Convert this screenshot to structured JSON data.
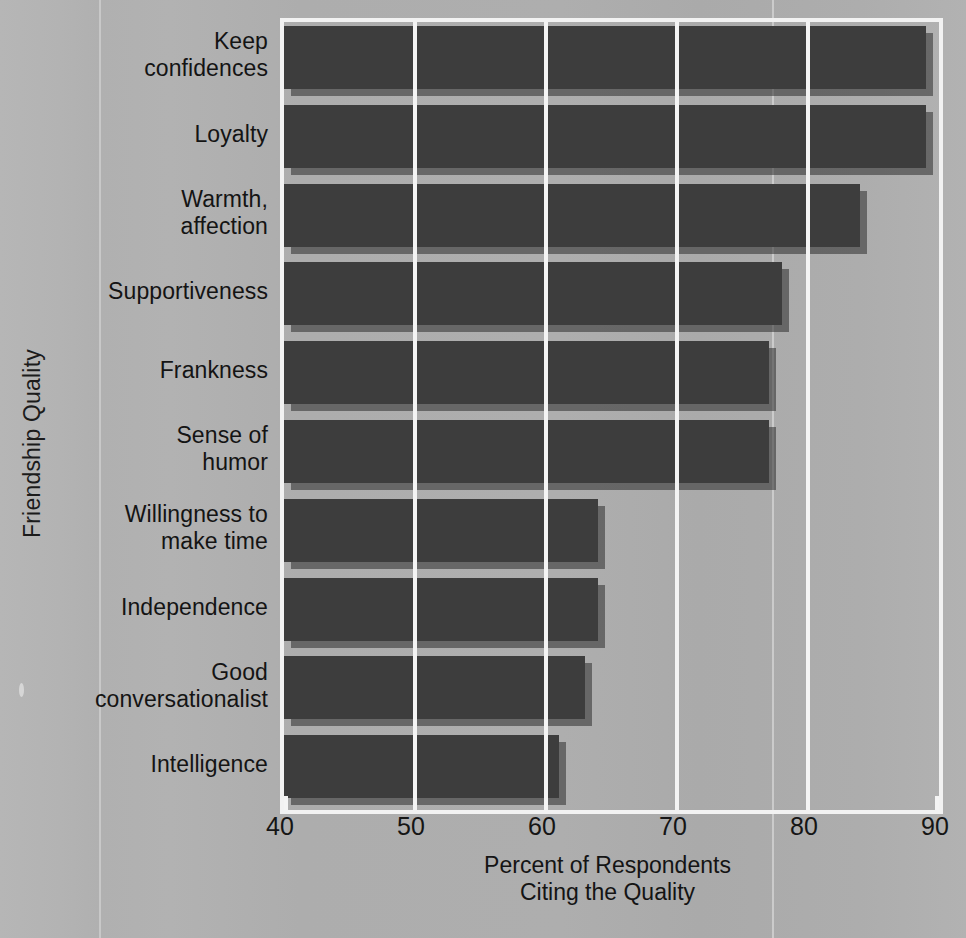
{
  "chart_data": {
    "type": "bar",
    "orientation": "horizontal",
    "title": "",
    "xlabel": "Percent of Respondents Citing the Quality",
    "xlabel_lines": [
      "Percent of Respondents",
      "Citing the Quality"
    ],
    "ylabel": "Friendship Quality",
    "categories": [
      "Keep confidences",
      "Loyalty",
      "Warmth, affection",
      "Supportiveness",
      "Frankness",
      "Sense of humor",
      "Willingness to make time",
      "Independence",
      "Good conversationalist",
      "Intelligence"
    ],
    "category_lines": [
      [
        "Keep",
        "confidences"
      ],
      [
        "Loyalty"
      ],
      [
        "Warmth,",
        "affection"
      ],
      [
        "Supportiveness"
      ],
      [
        "Frankness"
      ],
      [
        "Sense of",
        "humor"
      ],
      [
        "Willingness to",
        "make time"
      ],
      [
        "Independence"
      ],
      [
        "Good",
        "conversationalist"
      ],
      [
        "Intelligence"
      ]
    ],
    "values": [
      89,
      89,
      84,
      78,
      77,
      77,
      64,
      64,
      63,
      61
    ],
    "xlim": [
      40,
      90
    ],
    "xticks": [
      40,
      50,
      60,
      70,
      80,
      90
    ],
    "xtick_labels": [
      "40",
      "50",
      "60",
      "70",
      "80",
      "90"
    ],
    "grid": "vertical",
    "legend": "none",
    "colors": {
      "bar": "#3d3d3d",
      "bar_shadow": "#2e2e2e",
      "background": "#adadad",
      "gridline": "#f4f4f4",
      "frame": "#f2f2f2",
      "text": "#141414"
    }
  }
}
